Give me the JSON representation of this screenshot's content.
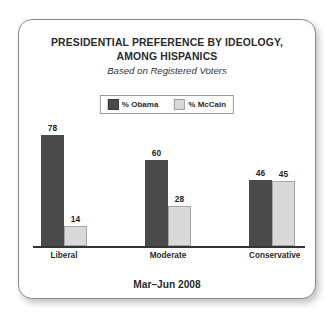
{
  "card": {
    "title_lines": [
      "PRESIDENTIAL PREFERENCE BY IDEOLOGY,",
      "AMONG HISPANICS"
    ],
    "subtitle": "Based on Registered Voters",
    "footer": "Mar–Jun 2008"
  },
  "legend": {
    "entries": [
      {
        "label": "% Obama",
        "swatch": "dark-square-icon",
        "color": "#4a4a4a"
      },
      {
        "label": "% McCain",
        "swatch": "light-square-icon",
        "color": "#d9d9d9"
      }
    ]
  },
  "chart_data": {
    "type": "bar",
    "title": "PRESIDENTIAL PREFERENCE BY IDEOLOGY, AMONG HISPANICS",
    "subtitle": "Based on Registered Voters",
    "note": "Mar–Jun 2008",
    "categories": [
      "Liberal",
      "Moderate",
      "Conservative"
    ],
    "series": [
      {
        "name": "% Obama",
        "color": "#4a4a4a",
        "values": [
          78,
          60,
          46
        ]
      },
      {
        "name": "% McCain",
        "color": "#d9d9d9",
        "values": [
          14,
          28,
          45
        ]
      }
    ],
    "xlabel": "",
    "ylabel": "",
    "ylim": [
      0,
      85
    ],
    "grid": false,
    "legend_position": "top-center",
    "data_labels": true
  }
}
